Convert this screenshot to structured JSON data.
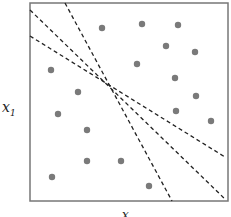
{
  "diagram": {
    "ylabel": "x",
    "ylabel_sub": "1",
    "xlabel": "x",
    "frame": {
      "x": 30,
      "y": 3,
      "w": 198,
      "h": 198,
      "stroke": "#777777"
    },
    "point_color": "#7a7a7a",
    "points": [
      [
        102,
        28
      ],
      [
        142,
        24
      ],
      [
        178,
        25
      ],
      [
        166,
        46
      ],
      [
        195,
        52
      ],
      [
        137,
        64
      ],
      [
        51,
        70
      ],
      [
        175,
        78
      ],
      [
        78,
        92
      ],
      [
        196,
        96
      ],
      [
        58,
        114
      ],
      [
        176,
        111
      ],
      [
        211,
        121
      ],
      [
        87,
        130
      ],
      [
        87,
        161
      ],
      [
        121,
        161
      ],
      [
        52,
        177
      ],
      [
        149,
        186
      ]
    ],
    "lines": [
      {
        "x1": 65,
        "y1": 3,
        "x2": 172,
        "y2": 201
      },
      {
        "x1": 30,
        "y1": 10,
        "x2": 226,
        "y2": 200
      },
      {
        "x1": 30,
        "y1": 36,
        "x2": 225,
        "y2": 157
      }
    ]
  }
}
